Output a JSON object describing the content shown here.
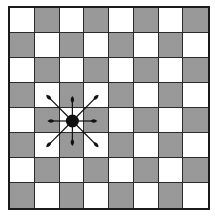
{
  "figure": {
    "type": "board-diagram",
    "rows": 8,
    "cols": 8,
    "pattern_rule": "dotted when (row+col) is odd",
    "colors": {
      "light_square": "#ffffff",
      "dark_square_fill": "#e6e6e6",
      "dark_square_dots": "#6e6e6e",
      "grid_line": "#2a2a2a",
      "border": "#1a1a1a",
      "piece": "#111111"
    },
    "piece": {
      "icon": "filled-circle-icon",
      "row": 4,
      "col": 2,
      "label": ""
    },
    "arrows": [
      {
        "direction": "up",
        "icon": "arrow-up-icon"
      },
      {
        "direction": "down",
        "icon": "arrow-down-icon"
      },
      {
        "direction": "left",
        "icon": "arrow-left-icon"
      },
      {
        "direction": "right",
        "icon": "arrow-right-icon"
      },
      {
        "direction": "up-left",
        "icon": "arrow-up-left-icon"
      },
      {
        "direction": "up-right",
        "icon": "arrow-up-right-icon"
      },
      {
        "direction": "down-left",
        "icon": "arrow-down-left-icon"
      },
      {
        "direction": "down-right",
        "icon": "arrow-down-right-icon"
      }
    ]
  }
}
